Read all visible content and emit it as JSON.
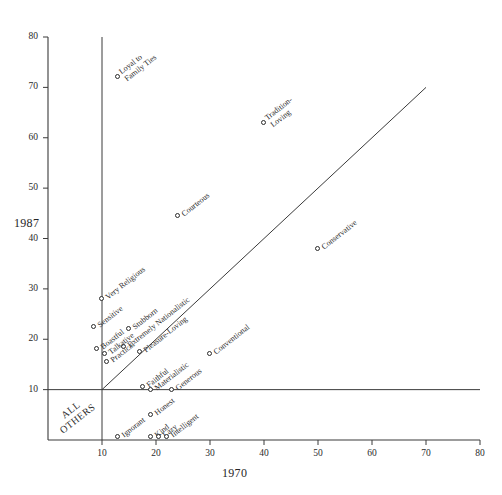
{
  "chart_data": {
    "type": "scatter",
    "title": "",
    "xlabel": "1970",
    "ylabel": "1987",
    "xlim": [
      0,
      80
    ],
    "ylim": [
      0,
      80
    ],
    "xticks": [
      10,
      20,
      30,
      40,
      50,
      60,
      70,
      80
    ],
    "yticks": [
      10,
      20,
      30,
      40,
      50,
      60,
      70,
      80
    ],
    "grid": false,
    "legend": null,
    "reference_lines": [
      {
        "name": "diagonal-identity-line",
        "type": "diagonal",
        "from": [
          10,
          10
        ],
        "to": [
          70,
          70
        ]
      },
      {
        "name": "vertical-threshold-line",
        "type": "vertical",
        "x": 10,
        "from_y": 0,
        "to_y": 80
      },
      {
        "name": "horizontal-threshold-line",
        "type": "horizontal",
        "y": 10,
        "from_x": 0,
        "to_x": 80
      }
    ],
    "annotations": [
      {
        "name": "all-others-region",
        "text": "ALL\nOTHERS",
        "x": 5,
        "y": 5
      }
    ],
    "points": [
      {
        "label": "Loyal to\nFamily Ties",
        "x": 13,
        "y": 72,
        "lines": 2
      },
      {
        "label": "Tradition-\nLoving",
        "x": 40,
        "y": 63,
        "lines": 2
      },
      {
        "label": "Courteous",
        "x": 24,
        "y": 44.5,
        "lines": 1
      },
      {
        "label": "Conservative",
        "x": 50,
        "y": 38,
        "lines": 1
      },
      {
        "label": "Very Religious",
        "x": 10,
        "y": 28,
        "lines": 1
      },
      {
        "label": "Sensitive",
        "x": 8.5,
        "y": 22.5,
        "lines": 1
      },
      {
        "label": "Stubborn",
        "x": 15,
        "y": 22,
        "lines": 1
      },
      {
        "label": "Extremely Nationalistic",
        "x": 14,
        "y": 18.5,
        "lines": 1
      },
      {
        "label": "Boastful",
        "x": 9,
        "y": 18,
        "lines": 1
      },
      {
        "label": "Talkative",
        "x": 10.5,
        "y": 17,
        "lines": 1
      },
      {
        "label": "Pleasure-Loving",
        "x": 17,
        "y": 17.5,
        "lines": 1
      },
      {
        "label": "Conventional",
        "x": 30,
        "y": 17,
        "lines": 1
      },
      {
        "label": "Practical",
        "x": 11,
        "y": 15.5,
        "lines": 1
      },
      {
        "label": "Faithful",
        "x": 17.5,
        "y": 10.5,
        "lines": 1
      },
      {
        "label": "Materialistic",
        "x": 19,
        "y": 10,
        "lines": 1
      },
      {
        "label": "Generous",
        "x": 23,
        "y": 10,
        "lines": 1
      },
      {
        "label": "Honest",
        "x": 19,
        "y": 5,
        "lines": 1
      },
      {
        "label": "Ignorant",
        "x": 13,
        "y": 0.5,
        "lines": 1
      },
      {
        "label": "Kind",
        "x": 19,
        "y": 0.5,
        "lines": 1
      },
      {
        "label": "Lazy",
        "x": 20.5,
        "y": 0.5,
        "lines": 1
      },
      {
        "label": "Intelligent",
        "x": 22,
        "y": 0.5,
        "lines": 1
      }
    ]
  },
  "colors": {
    "axis": "#3a3a3a",
    "point_stroke": "#2b2b2b",
    "text": "#1a1a1a",
    "background": "#ffffff"
  }
}
